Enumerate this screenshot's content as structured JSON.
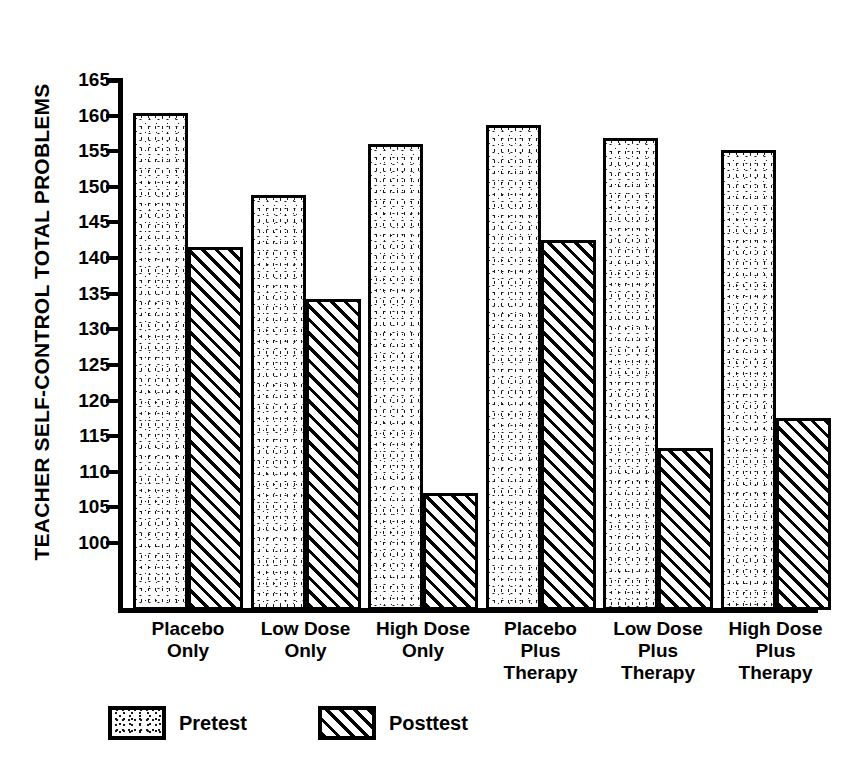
{
  "chart_data": {
    "type": "bar",
    "title": "",
    "xlabel": "",
    "ylabel": "TEACHER SELF-CONTROL TOTAL PROBLEMS",
    "ylim": [
      96,
      165
    ],
    "yticks": [
      100,
      105,
      110,
      115,
      120,
      125,
      130,
      135,
      140,
      145,
      150,
      155,
      160,
      165
    ],
    "grid": false,
    "legend_position": "bottom-left",
    "categories": [
      "Placebo\nOnly",
      "Low Dose\nOnly",
      "High Dose\nOnly",
      "Placebo\nPlus\nTherapy",
      "Low Dose\nPlus\nTherapy",
      "High Dose\nPlus\nTherapy"
    ],
    "series": [
      {
        "name": "Pretest",
        "fill": "stipple",
        "values": [
          160.3,
          148.8,
          156.0,
          158.7,
          156.8,
          155.2
        ]
      },
      {
        "name": "Posttest",
        "fill": "hatch",
        "values": [
          141.6,
          134.2,
          107.0,
          142.6,
          113.3,
          117.5
        ]
      }
    ]
  },
  "legend": {
    "items": [
      {
        "label": "Pretest"
      },
      {
        "label": "Posttest"
      }
    ]
  },
  "colors": {
    "ink": "#000000",
    "paper": "#ffffff"
  }
}
